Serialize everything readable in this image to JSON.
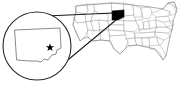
{
  "figure": {
    "name": "us-locator-map-south-dakota",
    "background_color": "#ffffff",
    "width": 188,
    "height": 90
  },
  "base_map": {
    "name": "united-states-outline-map",
    "country": "United States",
    "state_border_color": "#9a9a9a",
    "nation_outline_color": "#8a8a8a",
    "fill_color": "#ffffff"
  },
  "highlight": {
    "state": "South Dakota",
    "fill_color": "#000000",
    "stroke_color": "#000000"
  },
  "magnifier": {
    "name": "magnifier-inset",
    "circle_stroke_color": "#2b2b2b",
    "circle_fill_color": "#ffffff",
    "center_x": 37,
    "center_y": 46,
    "radius": 34
  },
  "inset_state": {
    "name": "south-dakota-enlarged-outline",
    "label": "South Dakota",
    "stroke_color": "#6b6b6b",
    "fill_color": "#ffffff"
  },
  "capital_marker": {
    "name": "capital-star",
    "label": "Pierre",
    "symbol": "star",
    "color": "#000000"
  },
  "leader_lines": {
    "name": "magnifier-leader-lines",
    "color": "#1a1a1a",
    "count": 2
  }
}
